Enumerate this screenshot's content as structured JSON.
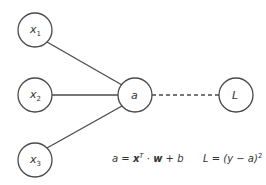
{
  "diagram": {
    "nodes": [
      {
        "id": "x1",
        "label": "x",
        "subscript": "1",
        "cx": 35,
        "cy": 30
      },
      {
        "id": "x2",
        "label": "x",
        "subscript": "2",
        "cx": 35,
        "cy": 95
      },
      {
        "id": "x3",
        "label": "x",
        "subscript": "3",
        "cx": 35,
        "cy": 160
      },
      {
        "id": "a",
        "label": "a",
        "cx": 135,
        "cy": 95
      },
      {
        "id": "L",
        "label": "L",
        "cx": 236,
        "cy": 95
      }
    ],
    "edges": [
      {
        "from": "x1",
        "to": "a",
        "style": "solid"
      },
      {
        "from": "x2",
        "to": "a",
        "style": "solid"
      },
      {
        "from": "x3",
        "to": "a",
        "style": "solid"
      },
      {
        "from": "a",
        "to": "L",
        "style": "dashed"
      }
    ],
    "formulas": {
      "activation": {
        "lhs": "a",
        "eq": " = ",
        "x": "x",
        "sup": "T",
        "dot": " · ",
        "w": "w",
        "rest": " + b"
      },
      "loss": {
        "text": "L = (y − a)",
        "sup": "2"
      }
    }
  }
}
